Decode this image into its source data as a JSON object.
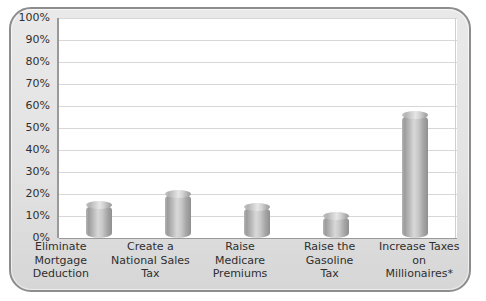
{
  "chart_data": {
    "type": "bar",
    "title": "",
    "subtitle": "",
    "xlabel": "",
    "ylabel": "",
    "ylim": [
      0,
      100
    ],
    "grid": true,
    "legend": "none",
    "y_unit": "%",
    "categories": [
      "Eliminate Mortgage Deduction",
      "Create a National Sales Tax",
      "Raise Medicare Premiums",
      "Raise the Gasoline Tax",
      "Increase Taxes on Millionaires*"
    ],
    "category_lines": [
      [
        "Eliminate",
        "Mortgage",
        "Deduction"
      ],
      [
        "Create a",
        "National Sales",
        "Tax"
      ],
      [
        "Raise",
        "Medicare",
        "Premiums"
      ],
      [
        "Raise the",
        "Gasoline",
        "Tax"
      ],
      [
        "Increase Taxes",
        "on",
        "Millionaires*"
      ]
    ],
    "values": [
      15,
      20,
      14,
      10,
      56
    ],
    "tick_labels": [
      "100%",
      "90%",
      "80%",
      "70%",
      "60%",
      "50%",
      "40%",
      "30%",
      "20%",
      "10%",
      "0%"
    ],
    "tick_values": [
      100,
      90,
      80,
      70,
      60,
      50,
      40,
      30,
      20,
      10,
      0
    ],
    "colors": {
      "bar_light": "#d8d8d8",
      "bar_mid": "#b4b4b4",
      "bar_dark": "#8f8f8f",
      "gridline": "#d7d7d7",
      "axis": "#9a9a9a",
      "panel": "#e3e3e3",
      "panel_border": "#8d8d8d",
      "plot_background": "#ffffff",
      "text": "#2f2f2f"
    }
  }
}
